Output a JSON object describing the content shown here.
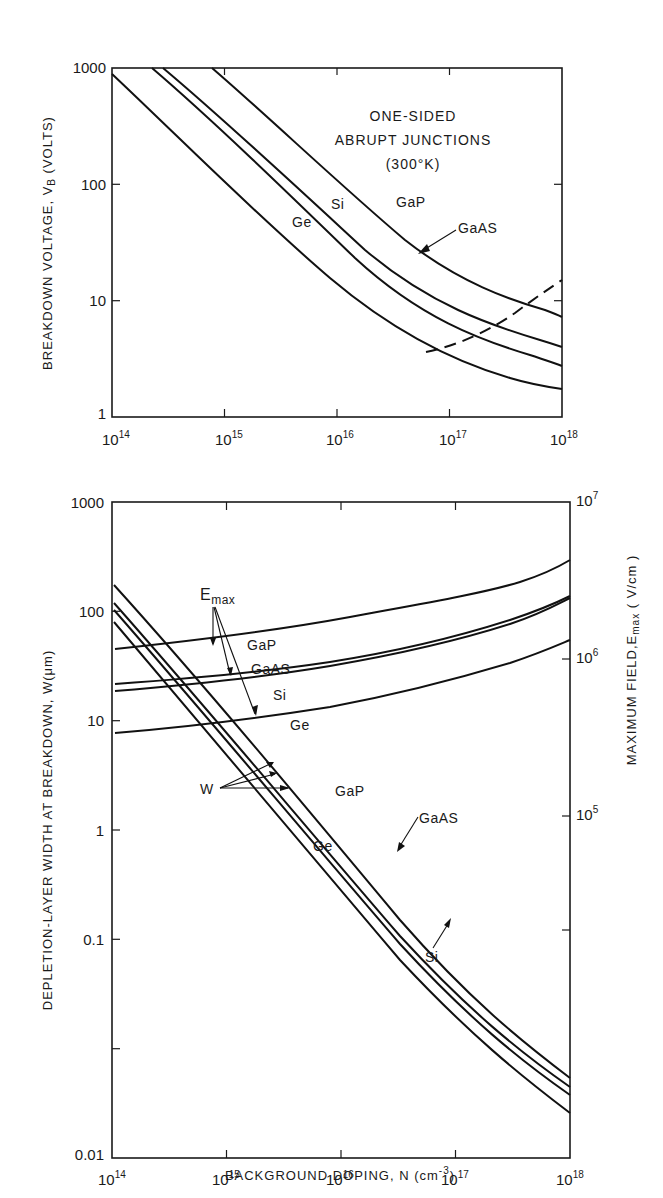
{
  "chart_data": [
    {
      "id": "top",
      "type": "line",
      "title": "One-sided abrupt junctions (300°K)",
      "annotation": [
        "ONE-SIDED",
        "ABRUPT JUNCTIONS",
        "(300°K)"
      ],
      "xlabel": "",
      "ylabel": "BREAKDOWN VOLTAGE, V_B (VOLTS)",
      "ylabel_parts": {
        "pre": "BREAKDOWN  VOLTAGE, V",
        "sub": "B",
        "post": " (VOLTS)"
      },
      "xscale": "log",
      "yscale": "log",
      "xlim": [
        100000000000000.0,
        1e+18
      ],
      "ylim": [
        1,
        1000
      ],
      "x_ticks": [
        {
          "base": "10",
          "exp": "14"
        },
        {
          "base": "10",
          "exp": "15"
        },
        {
          "base": "10",
          "exp": "16"
        },
        {
          "base": "10",
          "exp": "17"
        },
        {
          "base": "10",
          "exp": "18"
        }
      ],
      "y_ticks": [
        "1",
        "10",
        "100",
        "1000"
      ],
      "grid": false,
      "x": [
        100000000000000.0,
        300000000000000.0,
        1000000000000000.0,
        3000000000000000.0,
        1e+16,
        3e+16,
        1e+17,
        3e+17,
        1e+18
      ],
      "series": [
        {
          "name": "Ge",
          "label": "Ge",
          "values": [
            900,
            280,
            95,
            34,
            13,
            6.2,
            3.6,
            2.4,
            1.8
          ]
        },
        {
          "name": "Si",
          "label": "Si",
          "values": [
            null,
            930,
            330,
            115,
            40,
            17,
            8.5,
            5.3,
            3.8
          ]
        },
        {
          "name": "GaAs",
          "label": "GaAS",
          "values": [
            null,
            null,
            420,
            150,
            52,
            22,
            11,
            6.8,
            4.8
          ]
        },
        {
          "name": "GaP",
          "label": "GaP",
          "values": [
            null,
            null,
            null,
            450,
            150,
            60,
            26,
            14,
            9
          ]
        },
        {
          "name": "Tunneling limit (dashed)",
          "style": "dashed",
          "x": [
            6e+16,
            1e+17,
            2e+17,
            4e+17,
            7e+17,
            1e+18
          ],
          "values": [
            3.6,
            4.2,
            5.8,
            8.2,
            11.5,
            15
          ]
        }
      ]
    },
    {
      "id": "bottom",
      "type": "line",
      "xlabel": "BACKGROUND DOPING, N (cm^-3)",
      "xlabel_parts": {
        "pre": "BACKGROUND DOPING, N  (cm",
        "sup": "-3",
        "post": ")"
      },
      "ylabel": "DEPLETION-LAYER WIDTH AT BREAKDOWN, W(μm)",
      "ylabel_right": "MAXIMUM FIELD, E_max (V/cm)",
      "ylabel_right_parts": {
        "pre": "MAXIMUM FIELD,E",
        "sub": "max",
        "post": " ( V/cm )"
      },
      "xscale": "log",
      "yscale": "log",
      "xlim": [
        100000000000000.0,
        1e+18
      ],
      "ylim": [
        0.01,
        1000
      ],
      "ylim_right": [
        10000.0,
        10000000.0
      ],
      "x_ticks": [
        {
          "base": "10",
          "exp": "14"
        },
        {
          "base": "10",
          "exp": "15"
        },
        {
          "base": "10",
          "exp": "16"
        },
        {
          "base": "10",
          "exp": "17"
        },
        {
          "base": "10",
          "exp": "18"
        }
      ],
      "y_ticks": [
        "0.01",
        "0.1",
        "1",
        "10",
        "100",
        "1000"
      ],
      "y_ticks_right": [
        {
          "base": "10",
          "exp": "5"
        },
        {
          "base": "10",
          "exp": "6"
        },
        {
          "base": "10",
          "exp": "7"
        }
      ],
      "grid": false,
      "x": [
        100000000000000.0,
        1000000000000000.0,
        1e+16,
        1e+17,
        1e+18
      ],
      "width_series": [
        {
          "name": "W Ge",
          "label": "Ge",
          "values": [
            120,
            15,
            1.7,
            0.24,
            0.05
          ]
        },
        {
          "name": "W Si",
          "label": "Si",
          "values": [
            145,
            18.5,
            2.3,
            0.32,
            0.07
          ]
        },
        {
          "name": "W GaAs",
          "label": "GaAS",
          "values": [
            165,
            21,
            2.7,
            0.38,
            0.08
          ]
        },
        {
          "name": "W GaP",
          "label": "GaP",
          "values": [
            230,
            31,
            4.0,
            0.55,
            0.1
          ]
        }
      ],
      "field_series_Vcm": [
        {
          "name": "Emax Ge",
          "label": "Ge",
          "values": [
            140000.0,
            180000.0,
            230000.0,
            330000.0,
            600000.0
          ]
        },
        {
          "name": "Emax Si",
          "label": "Si",
          "values": [
            250000.0,
            300000.0,
            390000.0,
            550000.0,
            1200000.0
          ]
        },
        {
          "name": "Emax GaAs",
          "label": "GaAS",
          "values": [
            290000.0,
            330000.0,
            410000.0,
            570000.0,
            1200000.0
          ]
        },
        {
          "name": "Emax GaP",
          "label": "GaP",
          "values": [
            460000.0,
            560000.0,
            670000.0,
            900000.0,
            1800000.0
          ]
        }
      ],
      "annotations": {
        "emax": {
          "main": "E",
          "sub": "max"
        },
        "w": "W",
        "field_labels": [
          "GaP",
          "GaAS",
          "Si",
          "Ge"
        ],
        "width_labels": [
          "GaP",
          "GaAS",
          "Ge",
          "Si"
        ]
      }
    }
  ]
}
